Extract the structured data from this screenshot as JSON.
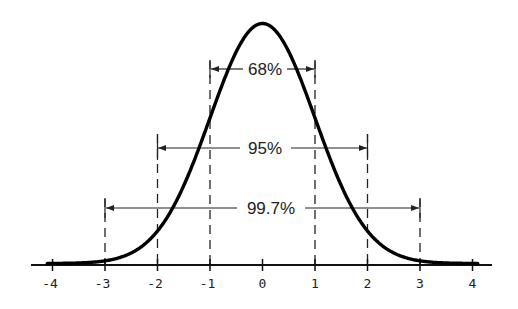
{
  "chart_data": {
    "type": "line",
    "title": "",
    "subtitle": "",
    "xlabel": "",
    "ylabel": "",
    "xlim": [
      -4,
      4
    ],
    "grid": false,
    "legend": null,
    "x_ticks": [
      -4,
      -3,
      -2,
      -1,
      0,
      1,
      2,
      3,
      4
    ],
    "x_tick_labels": [
      "-4",
      "-3",
      "-2",
      "-1",
      "0",
      "1",
      "2",
      "3",
      "4"
    ],
    "series": [
      {
        "name": "normal density",
        "function": "exp(-x^2/2)/sqrt(2*pi)",
        "x": [
          -4,
          -3.5,
          -3,
          -2.5,
          -2,
          -1.5,
          -1,
          -0.5,
          0,
          0.5,
          1,
          1.5,
          2,
          2.5,
          3,
          3.5,
          4
        ],
        "y": [
          0.0001,
          0.0009,
          0.0044,
          0.0175,
          0.054,
          0.1295,
          0.242,
          0.3521,
          0.3989,
          0.3521,
          0.242,
          0.1295,
          0.054,
          0.0175,
          0.0044,
          0.0009,
          0.0001
        ]
      }
    ],
    "annotations": [
      {
        "label": "68%",
        "from": -1,
        "to": 1,
        "type": "interval-bracket"
      },
      {
        "label": "95%",
        "from": -2,
        "to": 2,
        "type": "interval-bracket"
      },
      {
        "label": "99.7%",
        "from": -3,
        "to": 3,
        "type": "interval-bracket"
      }
    ],
    "reference_lines": [
      {
        "x": -3,
        "style": "dashed"
      },
      {
        "x": -2,
        "style": "dashed"
      },
      {
        "x": -1,
        "style": "dashed"
      },
      {
        "x": 1,
        "style": "dashed"
      },
      {
        "x": 2,
        "style": "dashed"
      },
      {
        "x": 3,
        "style": "dashed"
      }
    ]
  },
  "axis": {
    "tick_labels": [
      "-4",
      "-3",
      "-2",
      "-1",
      "0",
      "1",
      "2",
      "3",
      "4"
    ]
  },
  "brackets": {
    "b68": "68%",
    "b95": "95%",
    "b997": "99.7%"
  },
  "colors": {
    "curve": "#000000",
    "axis": "#111111",
    "text": "#222222",
    "background": "#ffffff"
  }
}
